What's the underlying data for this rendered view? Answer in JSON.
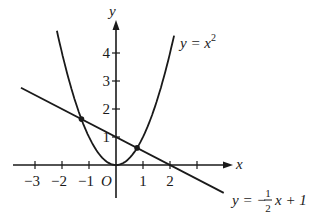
{
  "chart_data": {
    "type": "line",
    "title": "",
    "xlabel": "x",
    "ylabel": "y",
    "origin_label": "O",
    "x_ticks": [
      -3,
      -2,
      -1,
      1,
      2,
      3
    ],
    "x_tick_labels": [
      "−3",
      "−2",
      "−1",
      "1",
      "2",
      ""
    ],
    "y_ticks": [
      1,
      2,
      3,
      4
    ],
    "y_tick_labels": [
      "1",
      "2",
      "3",
      "4"
    ],
    "xlim": [
      -3.8,
      4.4
    ],
    "ylim": [
      -1.2,
      5.5
    ],
    "grid": false,
    "legend": "none",
    "series": [
      {
        "name": "parabola",
        "label_main": "y = x",
        "label_exp": "2",
        "equation": "y = x^2",
        "x_range": [
          -2.19,
          2.15
        ]
      },
      {
        "name": "line",
        "label_prefix": "y = −",
        "label_num": "1",
        "label_den": "2",
        "label_suffix": "x + 1",
        "equation": "y = -1/2 x + 1",
        "x_range": [
          -3.52,
          3.99
        ]
      }
    ],
    "intersection_points": [
      {
        "x": -1.28,
        "y": 1.64
      },
      {
        "x": 0.78,
        "y": 0.61
      }
    ]
  },
  "colors": {
    "ink": "#1a1a1a",
    "background": "#ffffff"
  }
}
